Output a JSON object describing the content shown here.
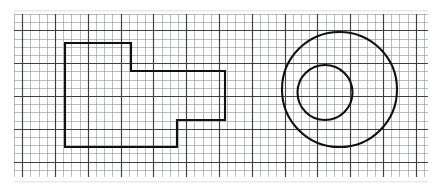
{
  "figure": {
    "type": "technical-drawing",
    "canvas": {
      "width": 437,
      "height": 189,
      "background": "#ffffff"
    }
  },
  "grid": {
    "name": "graph-paper-grid",
    "x_start": 14,
    "y_start": 14,
    "x_end": 428,
    "y_end": 177,
    "cell_size": 8.2,
    "minor_color": "#9aa0a6",
    "minor_width": 0.7,
    "major_color": "#3c4043",
    "major_width": 1.15,
    "major_every": 4,
    "major_offset_x": 1,
    "major_offset_y": 2
  },
  "shapes": {
    "stroke_color": "#101010",
    "stroke_width": 2.1,
    "polygon": {
      "name": "stepped-polygon",
      "label": "Stepped L-profile outline",
      "points": "65,43 131,43 131,71 225,71 225,120 177,120 177,147 65,147",
      "vertex_count": 8
    },
    "circle_large": {
      "name": "large-circle",
      "cx": 339.5,
      "cy": 89.5,
      "r": 57.5
    },
    "circle_small": {
      "name": "small-circle",
      "cx": 325,
      "cy": 92.5,
      "r": 27.5
    }
  },
  "paper": {
    "edge_top": 10,
    "edge_bottom": 182,
    "smudge_color": "#c9ccd0"
  }
}
